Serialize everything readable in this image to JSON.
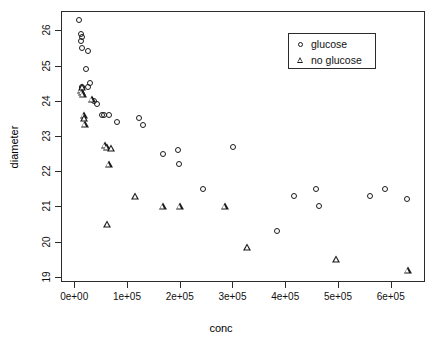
{
  "chart_data": {
    "type": "scatter",
    "title": "",
    "xlabel": "conc",
    "ylabel": "diameter",
    "xlim": [
      -25000,
      665000
    ],
    "ylim": [
      18.85,
      26.55
    ],
    "grid": false,
    "legend_position": "top-right",
    "x_ticks": [
      {
        "value": 0,
        "label": "0e+00"
      },
      {
        "value": 100000,
        "label": "1e+05"
      },
      {
        "value": 200000,
        "label": "2e+05"
      },
      {
        "value": 300000,
        "label": "3e+05"
      },
      {
        "value": 400000,
        "label": "4e+05"
      },
      {
        "value": 500000,
        "label": "5e+05"
      },
      {
        "value": 600000,
        "label": "6e+05"
      }
    ],
    "y_ticks": [
      {
        "value": 19,
        "label": "19"
      },
      {
        "value": 20,
        "label": "20"
      },
      {
        "value": 21,
        "label": "21"
      },
      {
        "value": 22,
        "label": "22"
      },
      {
        "value": 23,
        "label": "23"
      },
      {
        "value": 24,
        "label": "24"
      },
      {
        "value": 25,
        "label": "25"
      },
      {
        "value": 26,
        "label": "26"
      }
    ],
    "series": [
      {
        "name": "glucose",
        "marker": "circle",
        "color": "#1a1a1a",
        "points": [
          [
            9000,
            26.3
          ],
          [
            13000,
            25.9
          ],
          [
            14000,
            25.8
          ],
          [
            13500,
            25.7
          ],
          [
            15000,
            25.5
          ],
          [
            27000,
            25.4
          ],
          [
            22000,
            24.9
          ],
          [
            15000,
            24.4
          ],
          [
            14000,
            24.35
          ],
          [
            30000,
            24.5
          ],
          [
            26000,
            24.4
          ],
          [
            38000,
            24.0
          ],
          [
            44000,
            23.9
          ],
          [
            53000,
            23.6
          ],
          [
            57000,
            23.6
          ],
          [
            66000,
            23.6
          ],
          [
            82000,
            23.4
          ],
          [
            123000,
            23.5
          ],
          [
            131000,
            23.3
          ],
          [
            168000,
            22.5
          ],
          [
            197000,
            22.6
          ],
          [
            199000,
            22.2
          ],
          [
            301000,
            22.7
          ],
          [
            245000,
            21.5
          ],
          [
            385000,
            20.3
          ],
          [
            416000,
            21.3
          ],
          [
            459000,
            21.5
          ],
          [
            464000,
            21.0
          ],
          [
            561000,
            21.3
          ],
          [
            590000,
            21.5
          ],
          [
            631000,
            21.2
          ]
        ]
      },
      {
        "name": "no glucose",
        "marker": "triangle",
        "color": "#1a1a1a",
        "points": [
          [
            13000,
            24.3
          ],
          [
            15000,
            24.4
          ],
          [
            14500,
            24.25
          ],
          [
            16000,
            24.2
          ],
          [
            33000,
            24.05
          ],
          [
            18000,
            23.6
          ],
          [
            19000,
            23.5
          ],
          [
            20000,
            23.35
          ],
          [
            58000,
            22.75
          ],
          [
            62000,
            22.7
          ],
          [
            70000,
            22.65
          ],
          [
            66000,
            22.2
          ],
          [
            63000,
            20.5
          ],
          [
            116000,
            21.3
          ],
          [
            168000,
            21.0
          ],
          [
            200000,
            21.0
          ],
          [
            286000,
            21.0
          ],
          [
            328000,
            19.85
          ],
          [
            497000,
            19.5
          ],
          [
            632000,
            19.2
          ]
        ]
      }
    ]
  },
  "legend": {
    "entries": [
      {
        "label": "glucose",
        "marker": "circle"
      },
      {
        "label": "no glucose",
        "marker": "triangle"
      }
    ]
  },
  "axes": {
    "x_title": "conc",
    "y_title": "diameter"
  }
}
